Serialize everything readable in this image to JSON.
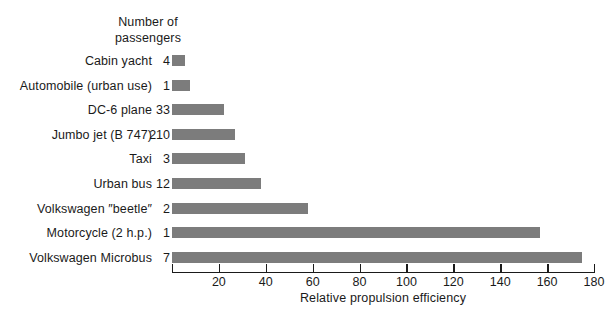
{
  "chart_data": {
    "type": "bar",
    "orientation": "horizontal",
    "title": "",
    "xlabel": "Relative propulsion efficiency",
    "ylabel": "",
    "header_caption": "Number of\npassengers",
    "xlim": [
      0,
      180
    ],
    "xticks": [
      0,
      20,
      40,
      60,
      80,
      100,
      120,
      140,
      160,
      180
    ],
    "xticklabels": [
      "",
      "20",
      "40",
      "60",
      "80",
      "100",
      "120",
      "140",
      "160",
      "180"
    ],
    "grid": false,
    "legend": "none",
    "bar_color": "#7c7c7c",
    "axis_color": "#1a1a1a",
    "categories": [
      "Cabin yacht",
      "Automobile (urban use)",
      "DC-6 plane",
      "Jumbo jet (B 747)",
      "Taxi",
      "Urban bus",
      "Volkswagen ″beetle″",
      "Motorcycle (2 h.p.)",
      "Volkswagen Microbus"
    ],
    "passengers": [
      "4",
      "1",
      "33",
      "210",
      "3",
      "12",
      "2",
      "1",
      "7"
    ],
    "values": [
      5.5,
      7.5,
      22,
      27,
      31,
      38,
      58,
      157,
      175
    ],
    "rows": [
      {
        "label": "Cabin yacht",
        "passengers": "4",
        "value": 5.5
      },
      {
        "label": "Automobile (urban use)",
        "passengers": "1",
        "value": 7.5
      },
      {
        "label": "DC-6 plane",
        "passengers": "33",
        "value": 22
      },
      {
        "label": "Jumbo jet (B 747)",
        "passengers": "210",
        "value": 27
      },
      {
        "label": "Taxi",
        "passengers": "3",
        "value": 31
      },
      {
        "label": "Urban bus",
        "passengers": "12",
        "value": 38
      },
      {
        "label": "Volkswagen ″beetle″",
        "passengers": "2",
        "value": 58
      },
      {
        "label": "Motorcycle (2 h.p.)",
        "passengers": "1",
        "value": 157
      },
      {
        "label": "Volkswagen Microbus",
        "passengers": "7",
        "value": 175
      }
    ]
  }
}
